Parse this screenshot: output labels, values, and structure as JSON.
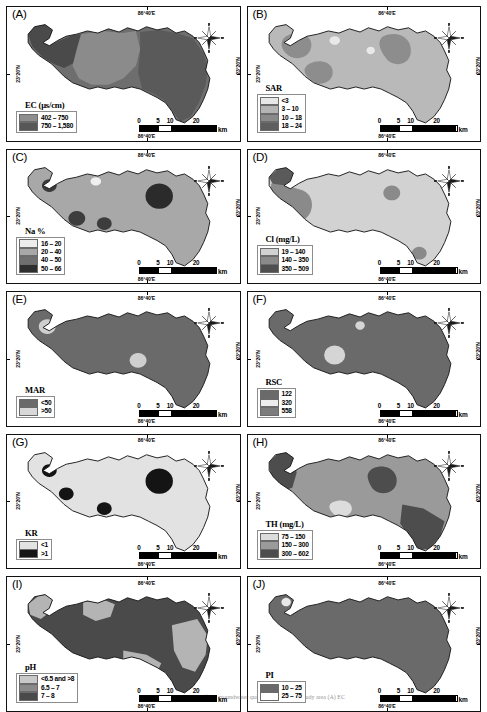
{
  "figure": {
    "coord_top": "86°40'E",
    "coord_bottom": "86°40'E",
    "coord_left": "23°20'N",
    "coord_right": "23°20'N",
    "compass_icon": "compass-rose-north-arrow",
    "scale_ticks": [
      "0",
      "5",
      "10",
      "20"
    ],
    "scale_unit": "km",
    "caption": "spatial distribution maps of the groundwater quality indices in the study area (A) EC"
  },
  "panels": [
    {
      "id": "A",
      "label": "(A)",
      "legend_title": "EC (μs/cm)",
      "legend": [
        {
          "label": "402 – 750",
          "color": "#8f8f8f"
        },
        {
          "label": "750 – 1,580",
          "color": "#575757"
        }
      ],
      "map_fill": "#6e6e6e",
      "regions": [
        {
          "color": "#4a4a4a",
          "shape": "north-west-dark"
        },
        {
          "color": "#8b8b8b",
          "shape": "central-light"
        },
        {
          "color": "#5a5a5a",
          "shape": "south-east-dark"
        }
      ]
    },
    {
      "id": "B",
      "label": "(B)",
      "legend_title": "SAR",
      "legend": [
        {
          "label": "<3",
          "color": "#e8e8e8"
        },
        {
          "label": "3 – 10",
          "color": "#b4b4b4"
        },
        {
          "label": "10 – 18",
          "color": "#8a8a8a"
        },
        {
          "label": "18 – 24",
          "color": "#5e5e5e"
        }
      ],
      "map_fill": "#b9b9b9",
      "regions": [
        {
          "color": "#8d8d8d",
          "shape": "nw-blob"
        },
        {
          "color": "#8d8d8d",
          "shape": "sw-blob"
        },
        {
          "color": "#8d8d8d",
          "shape": "ne-blob"
        },
        {
          "color": "#e9e9e9",
          "shape": "spot-light-1"
        },
        {
          "color": "#e9e9e9",
          "shape": "spot-light-2"
        }
      ]
    },
    {
      "id": "C",
      "label": "(C)",
      "legend_title": "Na %",
      "legend": [
        {
          "label": "16 – 20",
          "color": "#ededed"
        },
        {
          "label": "20 – 40",
          "color": "#a8a8a8"
        },
        {
          "label": "40 – 50",
          "color": "#6f6f6f"
        },
        {
          "label": "50 – 66",
          "color": "#2e2e2e"
        }
      ],
      "map_fill": "#a8a8a8",
      "regions": [
        {
          "color": "#3a3a3a",
          "shape": "dot-nw"
        },
        {
          "color": "#2b2b2b",
          "shape": "dot-ne-big"
        },
        {
          "color": "#3d3d3d",
          "shape": "dot-sw"
        },
        {
          "color": "#3d3d3d",
          "shape": "dot-s"
        },
        {
          "color": "#f0f0f0",
          "shape": "dot-light-n"
        }
      ]
    },
    {
      "id": "D",
      "label": "(D)",
      "legend_title": "Cl (mg/L)",
      "legend": [
        {
          "label": "19 – 140",
          "color": "#d2d2d2"
        },
        {
          "label": "140 – 350",
          "color": "#8a8a8a"
        },
        {
          "label": "350 – 509",
          "color": "#4f4f4f"
        }
      ],
      "map_fill": "#d2d2d2",
      "regions": [
        {
          "color": "#5a5a5a",
          "shape": "nw-corner-dark"
        },
        {
          "color": "#8a8a8a",
          "shape": "west-blob"
        },
        {
          "color": "#8a8a8a",
          "shape": "ne-spot"
        },
        {
          "color": "#8a8a8a",
          "shape": "se-spot"
        }
      ]
    },
    {
      "id": "E",
      "label": "(E)",
      "legend_title": "MAR",
      "legend": [
        {
          "label": "<50",
          "color": "#6a6a6a"
        },
        {
          "label": ">50",
          "color": "#d8d8d8"
        }
      ],
      "map_fill": "#6a6a6a",
      "regions": [
        {
          "color": "#cfcfcf",
          "shape": "nw-light-spot"
        },
        {
          "color": "#cfcfcf",
          "shape": "mid-light-spot"
        }
      ]
    },
    {
      "id": "F",
      "label": "(F)",
      "legend_title": "RSC",
      "legend": [
        {
          "label": "122",
          "color": "#6a6a6a"
        },
        {
          "label": "320",
          "color": "#ededed"
        },
        {
          "label": "558",
          "color": "#7c7c7c"
        }
      ],
      "map_fill": "#6a6a6a",
      "regions": [
        {
          "color": "#d5d5d5",
          "shape": "ring-center"
        },
        {
          "color": "#d5d5d5",
          "shape": "small-n"
        }
      ]
    },
    {
      "id": "G",
      "label": "(G)",
      "legend_title": "KR",
      "legend": [
        {
          "label": "<1",
          "color": "#e2e2e2"
        },
        {
          "label": ">1",
          "color": "#161616"
        }
      ],
      "map_fill": "#e2e2e2",
      "regions": [
        {
          "color": "#141414",
          "shape": "dot-nw"
        },
        {
          "color": "#141414",
          "shape": "dot-w"
        },
        {
          "color": "#141414",
          "shape": "dot-s"
        },
        {
          "color": "#141414",
          "shape": "dot-ne-big"
        }
      ]
    },
    {
      "id": "H",
      "label": "(H)",
      "legend_title": "TH (mg/L)",
      "legend": [
        {
          "label": "75 – 150",
          "color": "#dcdcdc"
        },
        {
          "label": "150 – 300",
          "color": "#9a9a9a"
        },
        {
          "label": "300 – 602",
          "color": "#4d4d4d"
        }
      ],
      "map_fill": "#9a9a9a",
      "regions": [
        {
          "color": "#4d4d4d",
          "shape": "nw-dark"
        },
        {
          "color": "#4d4d4d",
          "shape": "se-dark"
        },
        {
          "color": "#4d4d4d",
          "shape": "ne-dark-blob"
        },
        {
          "color": "#dcdcdc",
          "shape": "center-light"
        }
      ]
    },
    {
      "id": "I",
      "label": "(I)",
      "legend_title": "pH",
      "legend": [
        {
          "label": "<6.5 and >8",
          "color": "#c9c9c9"
        },
        {
          "label": "6.5 – 7",
          "color": "#8a8a8a"
        },
        {
          "label": "7 – 8",
          "color": "#4a4a4a"
        }
      ],
      "map_fill": "#4a4a4a",
      "regions": [
        {
          "color": "#b4b4b4",
          "shape": "nw-band"
        },
        {
          "color": "#b4b4b4",
          "shape": "n-band"
        },
        {
          "color": "#b4b4b4",
          "shape": "se-band"
        },
        {
          "color": "#b4b4b4",
          "shape": "s-band"
        }
      ]
    },
    {
      "id": "J",
      "label": "(J)",
      "legend_title": "PI",
      "legend": [
        {
          "label": "10 – 25",
          "color": "#6a6a6a"
        },
        {
          "label": "25 – 75",
          "color": "#ffffff"
        }
      ],
      "map_fill": "#6a6a6a",
      "regions": [
        {
          "color": "#e8e8e8",
          "shape": "nw-tiny-spot"
        }
      ]
    }
  ]
}
